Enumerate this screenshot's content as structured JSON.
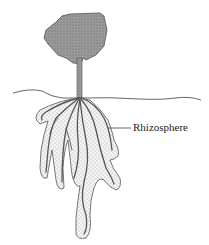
{
  "diagram": {
    "title": "",
    "labels": {
      "rhizosphere": "Rhizosphere"
    },
    "elements": [
      "tree-canopy",
      "stem",
      "soil-surface-line",
      "root-system",
      "rhizosphere-zone"
    ],
    "colors": {
      "canopy_fill": "#9a9a9a",
      "rhizosphere_fill": "#e8e8e8",
      "line": "#444444",
      "roots": "#555555"
    }
  }
}
